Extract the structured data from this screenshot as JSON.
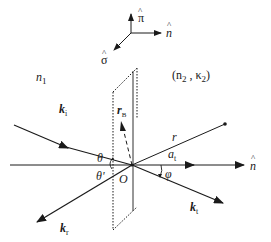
{
  "diagram": {
    "type": "optics-reflection-refraction-geometry",
    "triad": {
      "pi_hat": "π",
      "n_hat": "n",
      "sigma_hat": "σ",
      "hat": "^"
    },
    "media": {
      "medium1": "n",
      "medium1_sub": "1",
      "medium2_open": "(n",
      "medium2_sub": "2",
      "medium2_sep": " , κ",
      "medium2_sub2": "2",
      "medium2_close": ")"
    },
    "vectors": {
      "incident": "k",
      "incident_sub": "i",
      "reflected": "k",
      "reflected_sub": "r",
      "transmitted": "k",
      "transmitted_sub": "t",
      "position": "r",
      "attenuation": "a",
      "attenuation_sub": "t",
      "r_b": "r",
      "r_b_sub": "B"
    },
    "angles": {
      "theta": "θ",
      "theta_prime": "θ'",
      "phi": "φ"
    },
    "origin": "O",
    "normal_axis_label": "n",
    "colors": {
      "ink": "#1a1a1a",
      "background": "#ffffff"
    }
  }
}
